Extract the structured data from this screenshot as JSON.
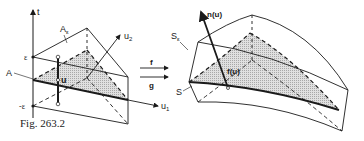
{
  "figure": {
    "caption": "Fig. 263.2",
    "left": {
      "axis_t_label": "t",
      "axis_u1_label": "u",
      "axis_u1_sub": "1",
      "axis_u2_label": "u",
      "axis_u2_sub": "2",
      "eps_label": "ε",
      "neg_eps_label": "-ε",
      "A_label": "A",
      "A_eps_label": "A",
      "A_eps_sub": "ε",
      "u_label": "u"
    },
    "mapping": {
      "f_label": "f",
      "g_label": "g"
    },
    "right": {
      "n_label": "n(u)",
      "f_label": "f(u)",
      "S_label": "S",
      "S_eps_label": "S",
      "S_eps_sub": "ε"
    },
    "colors": {
      "stroke": "#1a1a1a",
      "shade": "#d4d4d4"
    }
  }
}
